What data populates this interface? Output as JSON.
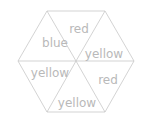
{
  "figure": {
    "shape": "hexagon",
    "background_color": "#ffffff",
    "line_color": "#c8c8c8",
    "text_color": "#b9b9b9",
    "sector_count": 6,
    "sectors": [
      {
        "id": "upper-left",
        "label": "blue",
        "label_x": 55,
        "label_y": 43
      },
      {
        "id": "upper",
        "label": "red",
        "label_x": 79,
        "label_y": 29
      },
      {
        "id": "upper-right",
        "label": "yellow",
        "label_x": 104,
        "label_y": 54
      },
      {
        "id": "lower-right",
        "label": "red",
        "label_x": 108,
        "label_y": 80
      },
      {
        "id": "lower",
        "label": "yellow",
        "label_x": 77,
        "label_y": 103
      },
      {
        "id": "lower-left",
        "label": "yellow",
        "label_x": 50,
        "label_y": 73
      }
    ],
    "geometry": {
      "center_x": 76,
      "center_y": 61,
      "vertex_left_x": 18,
      "vertex_left_y": 61,
      "vertex_right_x": 134,
      "vertex_right_y": 61,
      "top_left_x": 47,
      "top_left_y": 11,
      "top_right_x": 105,
      "top_right_y": 11,
      "bottom_left_x": 47,
      "bottom_left_y": 112,
      "bottom_right_x": 105,
      "bottom_right_y": 112
    }
  }
}
